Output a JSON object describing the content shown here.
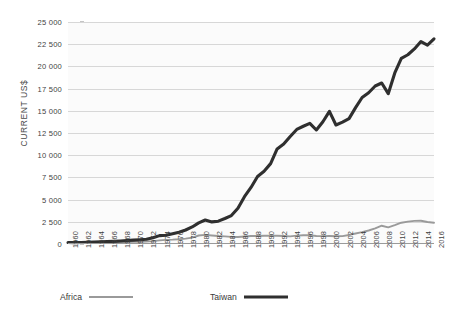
{
  "chart_data": {
    "type": "line",
    "title": "",
    "xlabel": "",
    "ylabel": "CURRENT US$",
    "ylim": [
      0,
      25000
    ],
    "xlim": [
      1960,
      2016
    ],
    "grid": true,
    "legend_position": "bottom-left",
    "ytick_labels": [
      "25 000",
      "22 500",
      "20 000",
      "17 500",
      "15 000",
      "12 500",
      "10 000",
      "7 500",
      "5 000",
      "2 500",
      "0"
    ],
    "ytick_values": [
      25000,
      22500,
      20000,
      17500,
      15000,
      12500,
      10000,
      7500,
      5000,
      2500,
      0
    ],
    "xtick_labels": [
      "1960",
      "1962",
      "1964",
      "1966",
      "1968",
      "1970",
      "1972",
      "1974",
      "1976",
      "1978",
      "1980",
      "1982",
      "1984",
      "1986",
      "1988",
      "1990",
      "1992",
      "1994",
      "1996",
      "1998",
      "2000",
      "2002",
      "2004",
      "2006",
      "2008",
      "2010",
      "2012",
      "2014",
      "2016"
    ],
    "x": [
      1960,
      1961,
      1962,
      1963,
      1964,
      1965,
      1966,
      1967,
      1968,
      1969,
      1970,
      1971,
      1972,
      1973,
      1974,
      1975,
      1976,
      1977,
      1978,
      1979,
      1980,
      1981,
      1982,
      1983,
      1984,
      1985,
      1986,
      1987,
      1988,
      1989,
      1990,
      1991,
      1992,
      1993,
      1994,
      1995,
      1996,
      1997,
      1998,
      1999,
      2000,
      2001,
      2002,
      2003,
      2004,
      2005,
      2006,
      2007,
      2008,
      2009,
      2010,
      2011,
      2012,
      2013,
      2014,
      2015,
      2016
    ],
    "series": [
      {
        "name": "Africa",
        "color": "#9a9a9a",
        "width": 1.9,
        "values": [
          130,
          135,
          140,
          150,
          160,
          170,
          180,
          190,
          205,
          220,
          240,
          255,
          275,
          320,
          410,
          470,
          490,
          530,
          600,
          720,
          960,
          1030,
          960,
          900,
          860,
          800,
          790,
          850,
          900,
          900,
          930,
          930,
          930,
          900,
          860,
          940,
          990,
          980,
          900,
          890,
          900,
          880,
          890,
          1020,
          1180,
          1340,
          1520,
          1760,
          2060,
          1880,
          2120,
          2400,
          2520,
          2600,
          2620,
          2480,
          2400
        ]
      },
      {
        "name": "Taiwan",
        "color": "#2f2f2f",
        "width": 3.1,
        "values": [
          163,
          160,
          175,
          190,
          215,
          240,
          265,
          300,
          345,
          390,
          440,
          485,
          540,
          700,
          940,
          980,
          1150,
          1320,
          1580,
          1920,
          2380,
          2700,
          2490,
          2570,
          2870,
          3200,
          4020,
          5325,
          6370,
          7610,
          8200,
          9050,
          10700,
          11250,
          12110,
          12900,
          13260,
          13590,
          12840,
          13770,
          14940,
          13400,
          13720,
          14120,
          15360,
          16500,
          17030,
          17790,
          18130,
          16930,
          19260,
          20900,
          21310,
          21970,
          22800,
          22400,
          23100
        ]
      }
    ]
  },
  "legend": {
    "items": [
      {
        "label": "Africa"
      },
      {
        "label": "Taiwan"
      }
    ]
  },
  "colors": {
    "africa": "#9a9a9a",
    "taiwan": "#2f2f2f",
    "gridline": "#d7d7d7",
    "plot_background": "#fbfbfb",
    "text": "#3a3a3a"
  }
}
